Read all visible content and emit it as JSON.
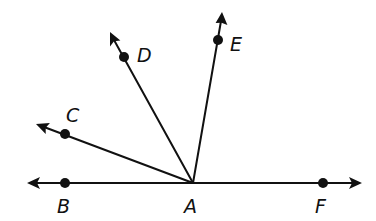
{
  "diagram": {
    "type": "rays-from-vertex",
    "vertex": {
      "label": "A",
      "x": 193,
      "y": 183
    },
    "line": {
      "label": "line BF",
      "left_tip": {
        "x": 27,
        "y": 183
      },
      "right_tip": {
        "x": 362,
        "y": 183
      }
    },
    "points": [
      {
        "label": "B",
        "x": 65,
        "y": 183,
        "label_x": 58,
        "label_y": 212
      },
      {
        "label": "F",
        "x": 323,
        "y": 183,
        "label_x": 316,
        "label_y": 212
      },
      {
        "label": "C",
        "x": 65,
        "y": 134,
        "label_x": 67,
        "label_y": 122
      },
      {
        "label": "D",
        "x": 124,
        "y": 57,
        "label_x": 137,
        "label_y": 62
      },
      {
        "label": "E",
        "x": 218,
        "y": 40,
        "label_x": 230,
        "label_y": 50
      }
    ],
    "vertex_label": {
      "text": "A",
      "x": 185,
      "y": 212
    },
    "rays": [
      {
        "name": "AC",
        "through": "C",
        "tip": {
          "x": 36,
          "y": 124
        }
      },
      {
        "name": "AD",
        "through": "D",
        "tip": {
          "x": 110,
          "y": 32
        }
      },
      {
        "name": "AE",
        "through": "E",
        "tip": {
          "x": 222,
          "y": 12
        }
      }
    ],
    "colors": {
      "stroke": "#111111",
      "background": "#ffffff"
    }
  },
  "labels": {
    "A": "A",
    "B": "B",
    "C": "C",
    "D": "D",
    "E": "E",
    "F": "F"
  }
}
